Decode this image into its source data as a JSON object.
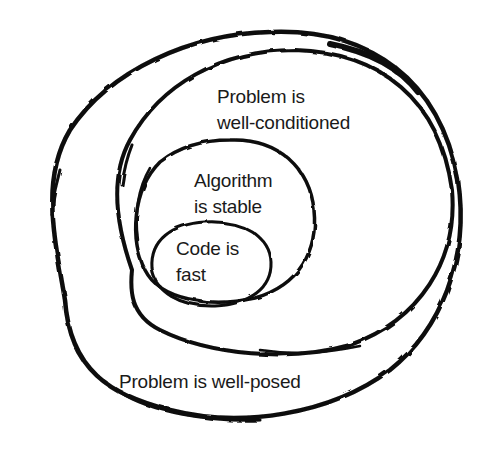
{
  "diagram": {
    "type": "nested-euler-diagram",
    "style": "hand-drawn ink on white",
    "colors": {
      "background": "#ffffff",
      "ink": "#0a0a0a",
      "text": "#1a1a1a"
    },
    "sets": [
      {
        "id": "well-posed",
        "level": 1,
        "lines": [
          "Problem is well-posed"
        ]
      },
      {
        "id": "well-conditioned",
        "level": 2,
        "lines": [
          "Problem is",
          "well-conditioned"
        ]
      },
      {
        "id": "algorithm-stable",
        "level": 3,
        "lines": [
          "Algorithm",
          "is stable"
        ]
      },
      {
        "id": "code-fast",
        "level": 4,
        "lines": [
          "Code is",
          "fast"
        ]
      }
    ]
  }
}
